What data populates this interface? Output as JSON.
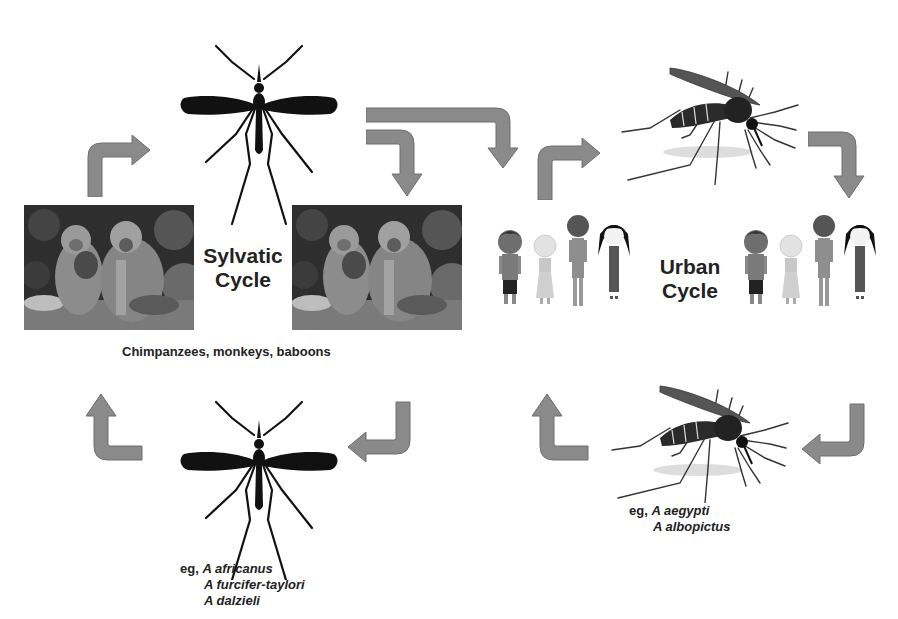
{
  "diagram": {
    "type": "transmission-cycle",
    "colors": {
      "arrow": "#8a8a8a",
      "text": "#222222",
      "mosquito_silhouette": "#111111"
    },
    "sylvatic": {
      "title_line1": "Sylvatic",
      "title_line2": "Cycle",
      "hosts_caption": "Chimpanzees, monkeys, baboons",
      "vectors_prefix": "eg,",
      "vectors": [
        "A africanus",
        "A furcifer-taylori",
        "A dalzieli"
      ],
      "icons": [
        "mosquito-silhouette-icon",
        "monkey-photo",
        "monkey-photo",
        "mosquito-silhouette-icon"
      ]
    },
    "urban": {
      "title_line1": "Urban",
      "title_line2": "Cycle",
      "vectors_prefix": "eg,",
      "vectors": [
        "A aegypti",
        "A albopictus"
      ],
      "icons": [
        "aedes-mosquito-icon",
        "people-group-icon",
        "people-group-icon",
        "aedes-mosquito-icon"
      ]
    },
    "arrows": [
      {
        "id": "sylvatic-top-left",
        "direction": "up-then-right"
      },
      {
        "id": "sylvatic-top-right",
        "direction": "right-then-down"
      },
      {
        "id": "sylvatic-bottom-right",
        "direction": "down-then-left"
      },
      {
        "id": "sylvatic-bottom-left",
        "direction": "right-then-up"
      },
      {
        "id": "spillover",
        "direction": "right-then-down"
      },
      {
        "id": "urban-top-left",
        "direction": "up-then-right"
      },
      {
        "id": "urban-top-right",
        "direction": "right-then-down"
      },
      {
        "id": "urban-bottom-right",
        "direction": "down-then-left"
      },
      {
        "id": "urban-bottom-left",
        "direction": "right-then-up"
      }
    ]
  }
}
